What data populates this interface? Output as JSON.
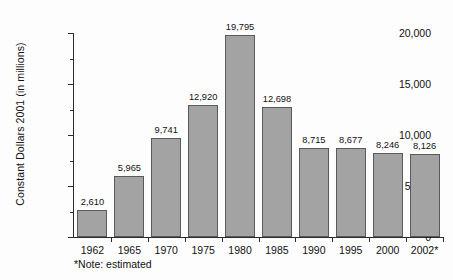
{
  "chart_data": {
    "type": "bar",
    "title": "",
    "xlabel": "",
    "ylabel": "Constant Dollars 2001 (in millions)",
    "categories": [
      "1962",
      "1965",
      "1970",
      "1975",
      "1980",
      "1985",
      "1990",
      "1995",
      "2000",
      "2002*"
    ],
    "values": [
      2610,
      5965,
      9741,
      12920,
      19795,
      12698,
      8715,
      8677,
      8246,
      8126
    ],
    "value_labels": [
      "2,610",
      "5,965",
      "9,741",
      "12,920",
      "19,795",
      "12,698",
      "8,715",
      "8,677",
      "8,246",
      "8,126"
    ],
    "ylim": [
      0,
      20000
    ],
    "ytick_values": [
      0,
      5000,
      10000,
      15000,
      20000
    ],
    "ytick_labels": [
      "0",
      "5,000",
      "10,000",
      "15,000",
      "20,000"
    ],
    "yminor_tick_values": [
      2500,
      7500,
      12500,
      17500
    ],
    "grid": false,
    "legend": false,
    "bar_color": "#a3a3a3",
    "bar_border_color": "#5a5a5a",
    "axis_color": "#2b2b2b",
    "footnote": "*Note: estimated"
  }
}
